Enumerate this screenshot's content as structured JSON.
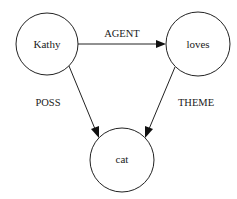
{
  "diagram": {
    "type": "semantic-network",
    "nodes": [
      {
        "id": "kathy",
        "label": "Kathy",
        "cx": 47,
        "cy": 44,
        "r": 31
      },
      {
        "id": "loves",
        "label": "loves",
        "cx": 198,
        "cy": 44,
        "r": 32
      },
      {
        "id": "cat",
        "label": "cat",
        "cx": 122,
        "cy": 160,
        "r": 32
      }
    ],
    "edges": [
      {
        "id": "agent",
        "from": "kathy",
        "to": "loves",
        "label": "AGENT"
      },
      {
        "id": "poss",
        "from": "kathy",
        "to": "cat",
        "label": "POSS"
      },
      {
        "id": "theme",
        "from": "loves",
        "to": "cat",
        "label": "THEME"
      }
    ],
    "colors": {
      "stroke": "#222222",
      "background": "#ffffff",
      "text": "#1a1a1a"
    }
  }
}
